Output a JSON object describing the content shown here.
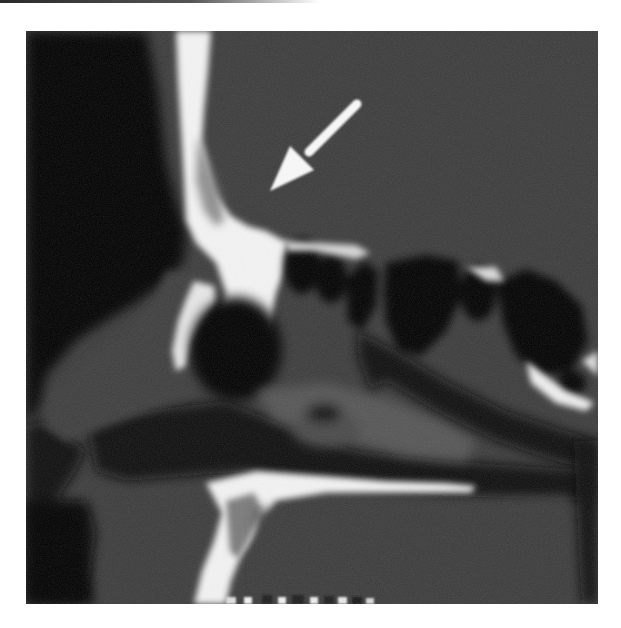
{
  "image": {
    "type": "sagittal CT scan",
    "modality": "CT",
    "view": "sagittal",
    "region": "paranasal sinuses / nasal cavity",
    "frame": {
      "x": 26,
      "y": 31,
      "width": 572,
      "height": 573
    },
    "colors": {
      "soft_tissue": "#3a3a3a",
      "air": "#050505",
      "bone": "#f2f2f2",
      "background": "#ffffff"
    }
  },
  "annotations": [
    {
      "type": "arrow",
      "color": "#ffffff",
      "tail": {
        "x": 356,
        "y": 104
      },
      "head": {
        "x": 268,
        "y": 190
      },
      "direction": "down-left"
    }
  ]
}
